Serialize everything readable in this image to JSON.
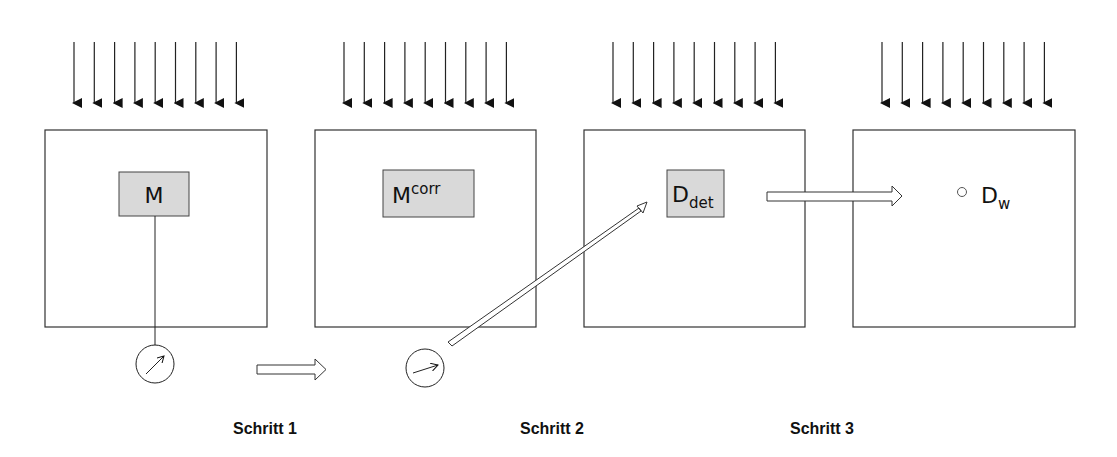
{
  "diagram": {
    "panels": [
      {
        "id": "panel-1",
        "label_main": "M",
        "label_sup": "",
        "label_sub": "",
        "has_field_arrows": true,
        "has_detector_box": true
      },
      {
        "id": "panel-2",
        "label_main": "M",
        "label_sup": "corr",
        "label_sub": "",
        "has_field_arrows": true,
        "has_detector_box": true
      },
      {
        "id": "panel-3",
        "label_main": "D",
        "label_sup": "",
        "label_sub": "det",
        "has_field_arrows": true,
        "has_detector_box": true
      },
      {
        "id": "panel-4",
        "label_main": "D",
        "label_sup": "",
        "label_sub": "w",
        "has_field_arrows": true,
        "has_detector_box": false,
        "point_marker": true
      }
    ],
    "arrows_per_panel": 9,
    "meters": [
      "meter-1",
      "meter-2"
    ],
    "steps": [
      "Schritt 1",
      "Schritt 2",
      "Schritt 3"
    ],
    "colors": {
      "stroke": "#111111",
      "box_fill": "#d9d9d9",
      "background": "#ffffff"
    }
  }
}
